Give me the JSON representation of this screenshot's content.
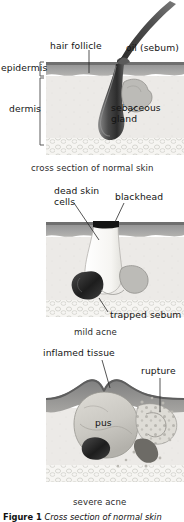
{
  "figure": {
    "caption_bold": "Figure 1",
    "caption_italic": "Cross section of normal skin"
  },
  "panels": [
    {
      "id": "normal-skin",
      "caption": "cross section of normal skin",
      "labels": {
        "hair_follicle": "hair follicle",
        "oil_sebum": "oil (sebum)",
        "epidermis": "epidermis",
        "dermis": "dermis",
        "sebaceous_gland_line1": "sebaceous",
        "sebaceous_gland_line2": "gland"
      }
    },
    {
      "id": "mild-acne",
      "caption": "mild acne",
      "labels": {
        "dead_skin_line1": "dead skin",
        "dead_skin_line2": "cells",
        "blackhead": "blackhead",
        "trapped_sebum": "trapped sebum"
      }
    },
    {
      "id": "severe-acne",
      "caption": "severe acne",
      "labels": {
        "inflamed_tissue": "inflamed tissue",
        "rupture": "rupture",
        "pus": "pus"
      }
    }
  ],
  "colors": {
    "epidermis": "#9c9c9c",
    "epidermis_top": "#6f6f6f",
    "dermis": "#ecebe8",
    "fat_layer": "#f4f3f0",
    "follicle_dark": "#3a3a3a",
    "gland_gray": "#b9b9b6",
    "plug_white": "#fbfbf9",
    "blackhead": "#141414",
    "pus": "#cfcec9",
    "leader_line": "#2a2a2a",
    "background": "#ffffff"
  }
}
